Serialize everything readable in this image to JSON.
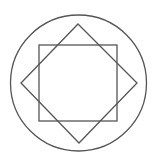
{
  "diagram": {
    "title": "",
    "stroke_color": "#555555",
    "background_color": "#ffffff",
    "shapes": [
      {
        "name": "outer-circle",
        "type": "circle"
      },
      {
        "name": "axis-aligned-square",
        "type": "square",
        "rotation_deg": 0
      },
      {
        "name": "rotated-square",
        "type": "square",
        "rotation_deg": 45
      }
    ]
  }
}
